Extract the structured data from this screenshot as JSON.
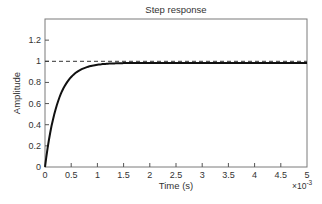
{
  "chart_data": {
    "type": "line",
    "title": "Step response",
    "xlabel": "Time (s)",
    "ylabel": "Amplitude",
    "x_multiplier": "×10",
    "x_multiplier_exp": "-3",
    "xlim": [
      0,
      0.005
    ],
    "ylim": [
      0,
      1.4
    ],
    "x_ticks": [
      0,
      0.5,
      1,
      1.5,
      2,
      2.5,
      3,
      3.5,
      4,
      4.5,
      5
    ],
    "x_tick_labels": [
      "0",
      "0.5",
      "1",
      "1.5",
      "2",
      "2.5",
      "3",
      "3.5",
      "4",
      "4.5",
      "5"
    ],
    "y_ticks": [
      0,
      0.2,
      0.4,
      0.6,
      0.8,
      1,
      1.2
    ],
    "y_tick_labels": [
      "0",
      "0.2",
      "0.4",
      "0.6",
      "0.8",
      "1",
      "1.2"
    ],
    "grid": false,
    "legend": null,
    "series": [
      {
        "name": "step response",
        "style": "solid",
        "color": "#111111",
        "x": [
          0,
          5e-05,
          0.0001,
          0.00015,
          0.0002,
          0.00025,
          0.0003,
          0.0004,
          0.0005,
          0.0006,
          0.0007,
          0.0008,
          0.001,
          0.0012,
          0.0015,
          0.002,
          0.0025,
          0.003,
          0.0035,
          0.004,
          0.0045,
          0.005
        ],
        "y": [
          0,
          0.18,
          0.33,
          0.45,
          0.55,
          0.62,
          0.69,
          0.79,
          0.86,
          0.9,
          0.93,
          0.95,
          0.97,
          0.98,
          0.985,
          0.985,
          0.985,
          0.985,
          0.985,
          0.985,
          0.985,
          0.985
        ]
      },
      {
        "name": "reference (final value)",
        "style": "dashed",
        "color": "#333333",
        "x": [
          0,
          0.005
        ],
        "y": [
          1,
          1
        ]
      }
    ]
  }
}
